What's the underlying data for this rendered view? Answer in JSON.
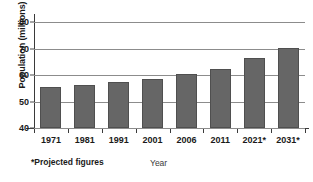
{
  "chart_data": {
    "type": "bar",
    "title": "",
    "xlabel": "Year",
    "ylabel": "Population (millions)",
    "categories": [
      "1971",
      "1981",
      "1991",
      "2001",
      "2006",
      "2011",
      "2021*",
      "2031*"
    ],
    "values": [
      55.5,
      56.2,
      57.3,
      58.5,
      60.2,
      62.3,
      66.5,
      70.3
    ],
    "ylim": [
      40,
      80
    ],
    "yticks": [
      40,
      50,
      60,
      70,
      80
    ],
    "ytick_labels": [
      "40",
      "50",
      "60",
      "70",
      "80"
    ],
    "grid": true,
    "legend": false,
    "annotations": [
      "*Projected figures"
    ],
    "bar_color": "#666666",
    "gridline_color": "#8c8c8c",
    "axis_color": "#3a3a3a"
  },
  "footnote": "*Projected figures"
}
